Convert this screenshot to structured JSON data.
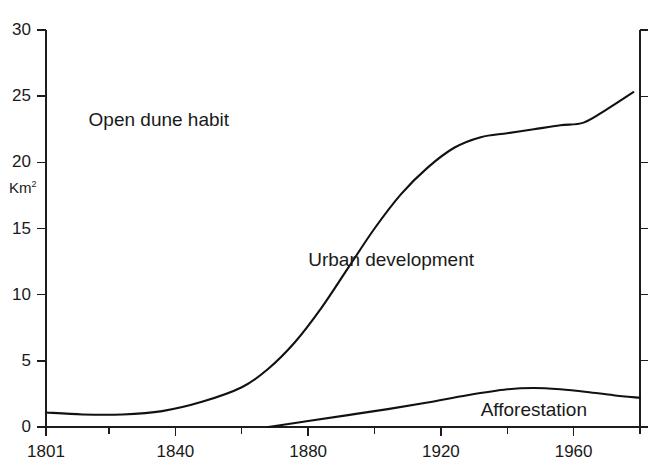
{
  "chart_data": {
    "type": "line",
    "title": "",
    "subtitle": "",
    "xlabel": "",
    "ylabel": "Km²",
    "ylabel_base": "Km",
    "ylabel_sup": "2",
    "xlim": [
      1801,
      1980
    ],
    "ylim": [
      0,
      30
    ],
    "grid": false,
    "legend": "none",
    "x_ticks": [
      1801,
      1840,
      1880,
      1920,
      1960
    ],
    "x_tick_labels": [
      "1801",
      "1840",
      "1880",
      "1920",
      "1960"
    ],
    "x_minor_ticks": [
      1820,
      1860,
      1900,
      1940,
      1980
    ],
    "y_ticks": [
      0,
      5,
      10,
      15,
      20,
      25,
      30
    ],
    "y_tick_labels": [
      "0",
      "5",
      "10",
      "15",
      "20",
      "25",
      "30"
    ],
    "series": [
      {
        "name": "Urban development",
        "x": [
          1801,
          1812,
          1824,
          1836,
          1848,
          1860,
          1868,
          1876,
          1884,
          1892,
          1900,
          1908,
          1916,
          1924,
          1932,
          1940,
          1948,
          1956,
          1963,
          1970,
          1978
        ],
        "values": [
          1.1,
          0.95,
          0.95,
          1.2,
          1.9,
          3.0,
          4.4,
          6.4,
          9.0,
          12.0,
          15.0,
          17.6,
          19.6,
          21.1,
          21.9,
          22.2,
          22.5,
          22.8,
          23.0,
          24.0,
          25.3
        ]
      },
      {
        "name": "Afforestation",
        "x": [
          1868,
          1880,
          1892,
          1904,
          1916,
          1928,
          1940,
          1948,
          1956,
          1964,
          1972,
          1980
        ],
        "values": [
          0.0,
          0.45,
          0.9,
          1.35,
          1.85,
          2.4,
          2.85,
          2.95,
          2.85,
          2.65,
          2.4,
          2.2
        ]
      }
    ],
    "annotations": [
      {
        "text": "Open dune habit",
        "x": 1835,
        "y": 23.2,
        "name": "open-dune-habit"
      },
      {
        "text": "Urban development",
        "x": 1905,
        "y": 12.6,
        "name": "urban-development"
      },
      {
        "text": "Afforestation",
        "x": 1948,
        "y": 1.25,
        "name": "afforestation"
      }
    ],
    "colors": {
      "line": "#111111",
      "axis": "#1c1c1c",
      "text": "#1a1a1a",
      "background": "#ffffff"
    }
  }
}
